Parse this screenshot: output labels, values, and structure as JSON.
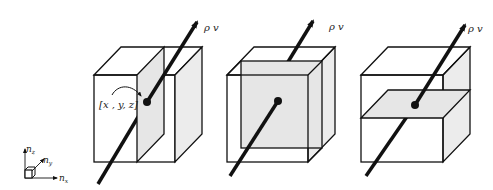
{
  "figure": {
    "panels": [
      {
        "name": "x-normal-plane",
        "flux_label": "ρ v",
        "point_label": "[x , y, z]"
      },
      {
        "name": "y-normal-plane",
        "flux_label": "ρ v"
      },
      {
        "name": "z-normal-plane",
        "flux_label": "ρ v"
      }
    ],
    "axes": {
      "z_label": "n",
      "z_sub": "z",
      "y_label": "n",
      "y_sub": "y",
      "x_label": "n",
      "x_sub": "x"
    },
    "colors": {
      "line": "#111111",
      "shade": "#e6e6e6"
    }
  }
}
